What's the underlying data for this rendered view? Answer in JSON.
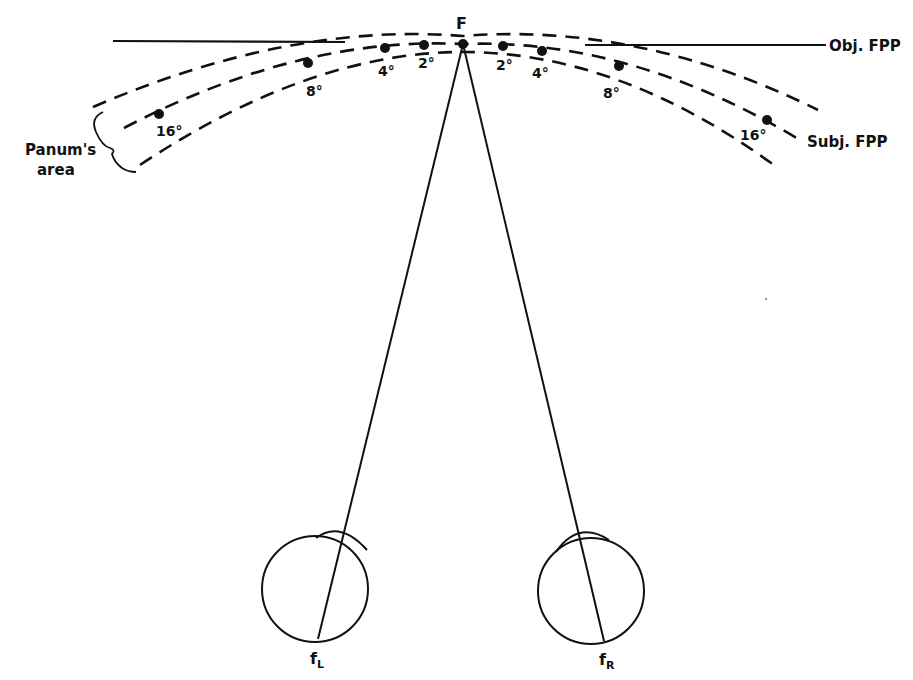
{
  "colors": {
    "background": "#ffffff",
    "ink": "#111111"
  },
  "labels": {
    "fixation_point": "F",
    "objective_fpp": "Obj. FPP",
    "subjective_fpp": "Subj. FPP",
    "panums_area_line1": "Panum's",
    "panums_area_line2": "area",
    "fovea_left_main": "f",
    "fovea_left_sub": "L",
    "fovea_right_main": "f",
    "fovea_right_sub": "R"
  },
  "eccentricity_points": {
    "left": [
      {
        "label": "2°"
      },
      {
        "label": "4°"
      },
      {
        "label": "8°"
      },
      {
        "label": "16°"
      }
    ],
    "right": [
      {
        "label": "2°"
      },
      {
        "label": "4°"
      },
      {
        "label": "8°"
      },
      {
        "label": "16°"
      }
    ]
  }
}
